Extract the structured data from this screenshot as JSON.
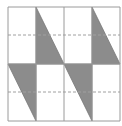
{
  "diagram": {
    "colors": {
      "background": "#ffffff",
      "grid_line": "#9a9a9a",
      "shade": "#8c8c8c",
      "dash": "#a0a0a0"
    },
    "grid": {
      "columns": 4,
      "rows": 2,
      "x": [
        8,
        36,
        64,
        92,
        120
      ],
      "y": [
        7,
        64,
        121
      ],
      "dashed_y": [
        35,
        92
      ]
    },
    "shaded_triangles": [
      {
        "points": "36,7 36,64 64,64"
      },
      {
        "points": "92,7 92,64 120,64"
      },
      {
        "points": "8,64 36,64 36,121"
      },
      {
        "points": "64,64 92,64 92,121"
      }
    ]
  }
}
